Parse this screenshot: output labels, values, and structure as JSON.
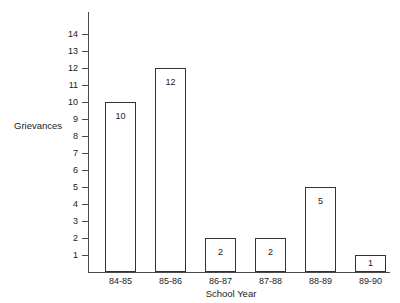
{
  "chart_data": {
    "type": "bar",
    "title": "",
    "categories": [
      "84-85",
      "85-86",
      "86-87",
      "87-88",
      "88-89",
      "89-90"
    ],
    "values": [
      10,
      12,
      2,
      2,
      5,
      1
    ],
    "value_labels": [
      "10",
      "12",
      "2",
      "2",
      "5",
      "1"
    ],
    "xlabel": "School Year",
    "ylabel": "Grievances",
    "ylim": [
      0,
      14
    ],
    "ytick_labels": [
      "14",
      "13",
      "12",
      "11",
      "10",
      "9",
      "8",
      "7",
      "6",
      "5",
      "4",
      "3",
      "2",
      "1"
    ],
    "ytick_values": [
      14,
      13,
      12,
      11,
      10,
      9,
      8,
      7,
      6,
      5,
      4,
      3,
      2,
      1
    ],
    "grid": false,
    "legend": null,
    "colors": {
      "bar_fill": "#ffffff",
      "bar_stroke": "#333333",
      "axis": "#4a4a4a",
      "text": "#1a1a1a",
      "background": "#ffffff"
    }
  }
}
